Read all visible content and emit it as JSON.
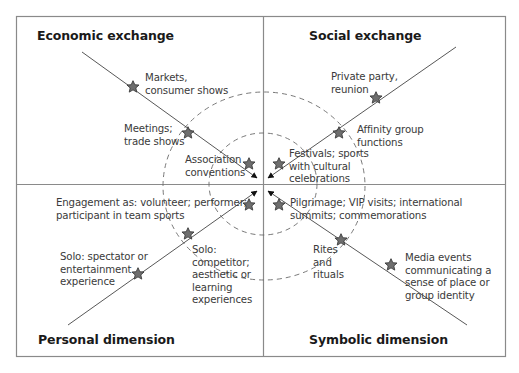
{
  "quadrants": {
    "top_left": {
      "heading": "Economic exchange"
    },
    "top_right": {
      "heading": "Social exchange"
    },
    "bottom_left": {
      "heading": "Personal dimension"
    },
    "bottom_right": {
      "heading": "Symbolic dimension"
    }
  },
  "labels": {
    "markets": "Markets,\nconsumer shows",
    "meetings": "Meetings;\ntrade shows",
    "association": "Association\nconventions",
    "private_party": "Private party,\nreunion",
    "affinity": "Affinity group\nfunctions",
    "festivals": "Festivals; sports\nwith cultural\ncelebrations",
    "engagement": "Engagement as: volunteer; performer;\nparticipant in team sports",
    "solo_spectator": "Solo: spectator or\nentertainment\nexperience",
    "solo_competitor": "Solo:\ncompetitor;\naesthetic or\nlearning\nexperiences",
    "pilgrimage": "Pilgrimage; VIP visits; international\nsummits; commemorations",
    "rites": "Rites\nand\nrituals",
    "media": "Media events\ncommunicating a\nsense of place or\ngroup identity"
  },
  "colors": {
    "border": "#8a8a8a",
    "line": "#444444",
    "star_fill": "#6e6e6e",
    "star_stroke": "#3c3c3c",
    "dashed": "#6a6a6a",
    "heading": "#1a1a1a",
    "text": "#3a3a3a"
  },
  "icons": {
    "marker": "star-icon",
    "arrowhead": "arrowhead-icon"
  }
}
